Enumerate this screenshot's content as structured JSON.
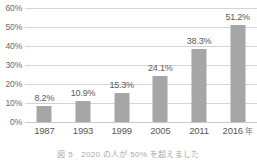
{
  "chart_data": {
    "type": "bar",
    "title": "",
    "subtitle": "",
    "xlabel": "",
    "ylabel": "",
    "categories": [
      "1987",
      "1993",
      "1999",
      "2005",
      "2011",
      "2016"
    ],
    "values": [
      8.2,
      10.9,
      15.3,
      24.1,
      38.3,
      51.2
    ],
    "data_labels": [
      "8.2%",
      "10.9%",
      "15.3%",
      "24.1%",
      "38.3%",
      "51.2%"
    ],
    "x_tick_labels": [
      "1987",
      "1993",
      "1999",
      "2005",
      "2011",
      "2016"
    ],
    "x_axis_unit": "年",
    "y_tick_labels": [
      "0%",
      "10%",
      "20%",
      "30%",
      "40%",
      "50%",
      "60%"
    ],
    "y_tick_values": [
      0,
      10,
      20,
      30,
      40,
      50,
      60
    ],
    "ylim": [
      0,
      60
    ],
    "y_tick_interval": 10,
    "grid": "horizontal",
    "legend": "none",
    "series": [
      {
        "name": "",
        "values": [
          8.2,
          10.9,
          15.3,
          24.1,
          38.3,
          51.2
        ]
      }
    ],
    "colors": {
      "bar": "#a6a6a6",
      "gridline": "#d4d4d4",
      "baseline": "#c9c9c9",
      "label_text": "#5a5a5a",
      "axis_text": "#6b6b6b",
      "background": "#ffffff"
    }
  },
  "caption": {
    "text": "図 5　2020 の人が 50% を超えました"
  }
}
